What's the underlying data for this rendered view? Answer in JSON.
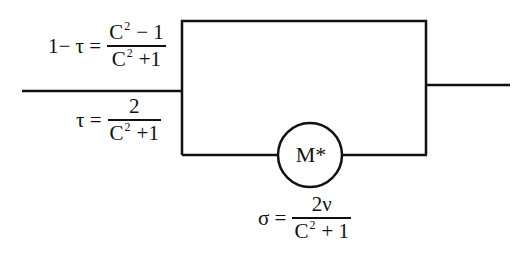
{
  "diagram": {
    "type": "parallel-path network",
    "components": {
      "box": {
        "label": "",
        "role": "upper bypass path"
      },
      "element": {
        "label": "M*",
        "shape": "circle"
      }
    },
    "equations": {
      "upper_branch": {
        "lhs": "1− τ =",
        "numerator_base": "C",
        "numerator_exp": "2",
        "numerator_rest": "− 1",
        "denominator_base": "C",
        "denominator_exp": "2",
        "denominator_rest": "+1"
      },
      "lower_branch": {
        "lhs": "τ =",
        "numerator": "2",
        "denominator_base": "C",
        "denominator_exp": "2",
        "denominator_rest": "+1"
      },
      "element_output": {
        "lhs": "σ =",
        "numerator": "2ν",
        "denominator_base": "C",
        "denominator_exp": "2",
        "denominator_rest": "+ 1"
      }
    },
    "colors": {
      "stroke": "#111111",
      "background": "#ffffff"
    }
  }
}
